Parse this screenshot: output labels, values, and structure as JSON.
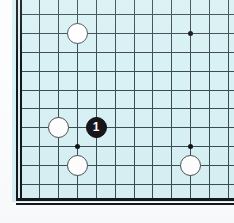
{
  "diagram": {
    "kind": "go-board-diagram",
    "caption": "",
    "board": {
      "background_color": "#d8f1f4",
      "line_color": "#3d4b55",
      "edge_color": "#14181c",
      "edges_visible": [
        "left",
        "bottom"
      ],
      "columns_x": [
        20,
        39,
        58,
        77,
        96,
        115,
        134,
        152,
        171,
        190,
        209,
        228
      ],
      "rows_y": [
        14,
        33,
        52,
        71,
        90,
        108,
        127,
        146,
        165,
        184,
        198
      ]
    },
    "star_points": [
      {
        "name": "star-point-top-right",
        "x": 190,
        "y": 33
      },
      {
        "name": "star-point-center-left",
        "x": 77,
        "y": 146
      },
      {
        "name": "star-point-center-right",
        "x": 190,
        "y": 146
      }
    ],
    "stones": [
      {
        "name": "white-stone-top",
        "color": "white",
        "x": 77,
        "y": 33,
        "label": ""
      },
      {
        "name": "white-stone-left",
        "color": "white",
        "x": 58,
        "y": 127,
        "label": ""
      },
      {
        "name": "white-stone-bottom-left",
        "color": "white",
        "x": 77,
        "y": 165,
        "label": ""
      },
      {
        "name": "white-stone-bottom-right",
        "color": "white",
        "x": 190,
        "y": 165,
        "label": ""
      },
      {
        "name": "black-stone-move-1",
        "color": "black",
        "x": 96,
        "y": 127,
        "label": "1"
      }
    ],
    "move_number_label": "1",
    "colors": {
      "board": "#d8f1f4",
      "grid": "#3d4b55",
      "edge": "#14181c",
      "black_stone": "#17171b",
      "white_stone": "#ffffff",
      "move_number_text": "#ffffff",
      "page": "#fbfdfe"
    }
  }
}
